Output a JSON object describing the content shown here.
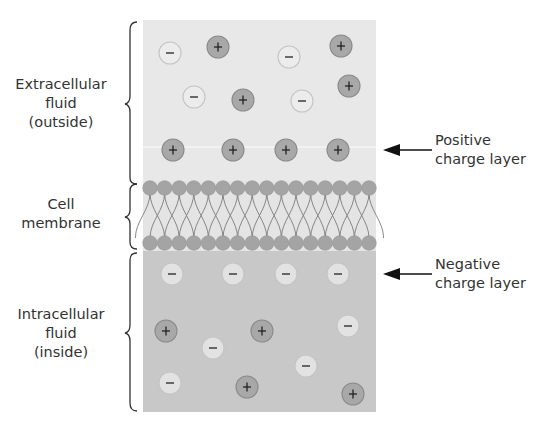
{
  "diagram": {
    "regions": [
      {
        "id": "extracellular",
        "label_lines": [
          "Extracellular",
          "fluid",
          "(outside)"
        ]
      },
      {
        "id": "membrane",
        "label_lines": [
          "Cell",
          "membrane"
        ]
      },
      {
        "id": "intracellular",
        "label_lines": [
          "Intracellular",
          "fluid",
          "(inside)"
        ]
      }
    ],
    "annotations": [
      {
        "id": "positive-layer",
        "label_lines": [
          "Positive",
          "charge layer"
        ]
      },
      {
        "id": "negative-layer",
        "label_lines": [
          "Negative",
          "charge layer"
        ]
      }
    ],
    "ions": {
      "extracellular": [
        {
          "sign": "−",
          "x": 170,
          "y": 53
        },
        {
          "sign": "+",
          "x": 218,
          "y": 47
        },
        {
          "sign": "−",
          "x": 289,
          "y": 57
        },
        {
          "sign": "+",
          "x": 341,
          "y": 46
        },
        {
          "sign": "−",
          "x": 194,
          "y": 97
        },
        {
          "sign": "+",
          "x": 243,
          "y": 100
        },
        {
          "sign": "−",
          "x": 302,
          "y": 101
        },
        {
          "sign": "+",
          "x": 349,
          "y": 86
        },
        {
          "sign": "+",
          "x": 173,
          "y": 150
        },
        {
          "sign": "+",
          "x": 233,
          "y": 150
        },
        {
          "sign": "+",
          "x": 286,
          "y": 150
        },
        {
          "sign": "+",
          "x": 338,
          "y": 150
        }
      ],
      "intracellular": [
        {
          "sign": "−",
          "x": 172,
          "y": 274
        },
        {
          "sign": "−",
          "x": 233,
          "y": 274
        },
        {
          "sign": "−",
          "x": 286,
          "y": 274
        },
        {
          "sign": "−",
          "x": 338,
          "y": 274
        },
        {
          "sign": "+",
          "x": 166,
          "y": 331
        },
        {
          "sign": "+",
          "x": 262,
          "y": 331
        },
        {
          "sign": "−",
          "x": 348,
          "y": 326
        },
        {
          "sign": "−",
          "x": 213,
          "y": 348
        },
        {
          "sign": "−",
          "x": 306,
          "y": 366
        },
        {
          "sign": "−",
          "x": 170,
          "y": 383
        },
        {
          "sign": "+",
          "x": 247,
          "y": 387
        },
        {
          "sign": "+",
          "x": 353,
          "y": 394
        }
      ]
    },
    "colors": {
      "extracellular_bg": "#e8e8e8",
      "membrane_bg": "#e4e4e4",
      "intracellular_bg": "#c8c8c8",
      "positive_ion": "#a8a8a8",
      "negative_ion_outside": "#ececec",
      "negative_ion_inside": "#e2e2e2",
      "phospholipid_head": "#a4a4a4",
      "line": "#2a2a2a"
    }
  }
}
